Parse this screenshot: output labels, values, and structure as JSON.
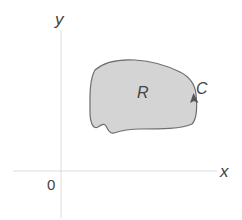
{
  "diagram": {
    "title": "",
    "axes": {
      "x_label": "x",
      "y_label": "y",
      "origin_label": "0",
      "color": "#d9d9d9"
    },
    "region": {
      "label": "R",
      "fill": "#d4d4d4",
      "stroke": "#6e6e6e"
    },
    "curve": {
      "label": "C",
      "orientation": "counterclockwise",
      "arrow_color": "#555555"
    },
    "text_color": "#444444"
  }
}
